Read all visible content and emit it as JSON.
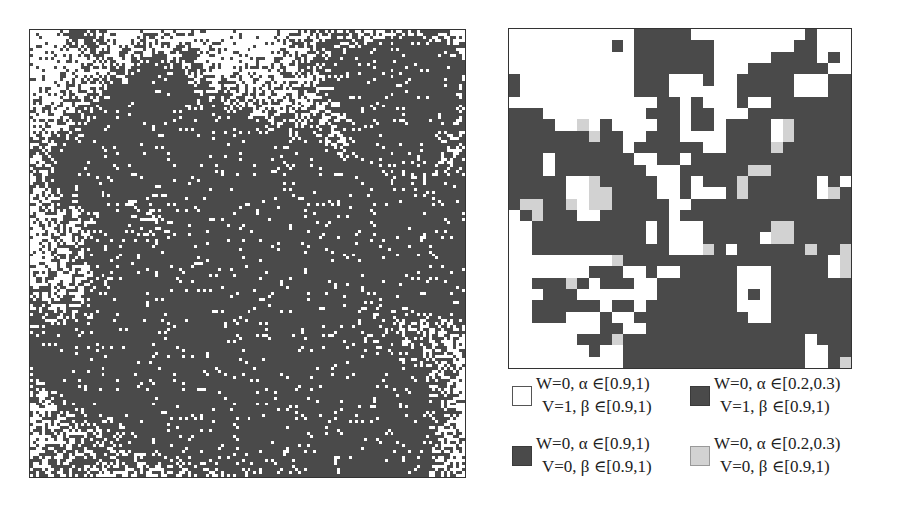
{
  "figure": {
    "left_panel": {
      "description": "fine-grained binary occupancy map",
      "grid_cols": 146,
      "grid_rows": 150,
      "colors": {
        "empty": "#ffffff",
        "occupied": "#4a4a4a"
      }
    },
    "right_panel": {
      "grid_size": 30,
      "colors": {
        "W": "#ffffff",
        "D": "#4a4a4a",
        "L": "#d2d2d2"
      },
      "rows": [
        "WWWWWWWWWWWDDDDDWWWWWWWWWWDWWW",
        "WWWWWWWWWDWDDDDDDDWWWWWWWDDWWW",
        "WWWWWWWWWWWDDDDDDDWWWWWDDDDWDW",
        "WWWWWWWWWWWDDDDDDDWWWDDDDDDDWW",
        "DWWWWWWWWWWDDDWWWDWWDDDDDWWWDD",
        "DWWWWWWWWWWDDDWWWWWWDDDDDWWWDD",
        "WWWWWWWWWWWWWDDWDWWWDWWDDDDDDD",
        "DDDWWWWWWWWWDDDWDDWWWDDDDDDDDD",
        "DDDDWWLWDWWWWDDWDDWDDDDWLDDDDD",
        "DDDDDDDLDDWWDDDWWWWDDDDWLDDDDD",
        "DDDDDDDDDDWDDDDDDWWDDDDLDDDDDD",
        "DDDWDDDDDDDWWDDWDDDDDDDDDDDDDD",
        "DDDWDDDDDDDDWWWDDDDDDLLDDDDDDD",
        "DDDDDWWLDDDDDWWDWDDDLDDDDDDWDW",
        "DDDDDWWLLDDDDWWDWWWDLDDDDDDWLD",
        "DLLDDLWLLDDDDDWWDDDDDDDDDDDDDD",
        "WDLDDDWWDDDDDDWDDDDDDDDDDDDDDD",
        "WWDDDDDDDDDDWDWWWDDDDDDLLDDDDD",
        "WWDDDDDDDDDDWDWWWDDDDDWLLDDDDD",
        "WWDDDDDDDDDDDDWWWLDWDDDDDDLDDL",
        "WWWWWWWWWLDDDDDDDDDDDDDDDDDDWL",
        "WWWWWWWDDDWWDWWDDDDDWWWDDDDDWL",
        "WWDDDLDWDDDWWDDDDDDDWWWDDDDDDD",
        "WWWDDDWWWWWWWDDDDDDDWDWDDDDDDD",
        "WWDDDDDDWDDWDDDDDDDDWWWDDDDDDD",
        "WWDDDWWWDWWDDDDDDDDDDWWDDDDDDD",
        "WWWWWWWWDDWWDDDDDDDDDDDDDDDDDD",
        "WWWWWWDDDLDDDDDDDDDDDDDDDDWDDD",
        "WWWWWWWDWWDDDDDDDDDDDDDDDDWWDD",
        "WWWWWWWWWWDDDDDDDDDDDDDDDDWWDL"
      ]
    },
    "legend": [
      {
        "swatch": "white",
        "line1": "W=0, α ∈[0.9,1)",
        "line2": "V=1, β ∈[0.9,1)"
      },
      {
        "swatch": "dark",
        "line1": "W=0, α ∈[0.2,0.3)",
        "line2": "V=1, β ∈[0.9,1)"
      },
      {
        "swatch": "mid",
        "line1": "W=0, α ∈[0.9,1)",
        "line2": "V=0, β ∈[0.9,1)"
      },
      {
        "swatch": "light",
        "line1": "W=0, α ∈[0.2,0.3)",
        "line2": "V=0, β ∈[0.9,1)"
      }
    ]
  }
}
